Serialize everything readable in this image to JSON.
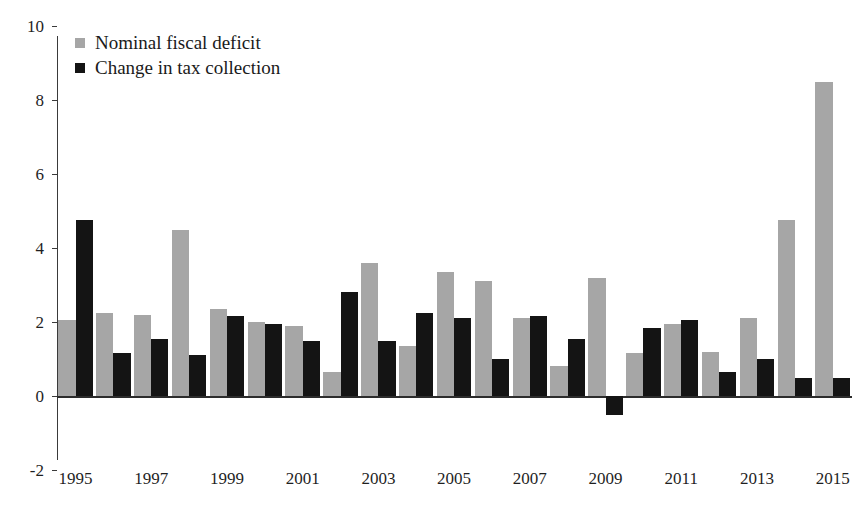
{
  "chart_data": {
    "type": "bar",
    "title": "",
    "subtitle": "",
    "xlabel": "",
    "ylabel": "",
    "ylim": [
      -2,
      10
    ],
    "ytick_labels": [
      "10",
      "8",
      "6",
      "4",
      "2",
      "0",
      "-2"
    ],
    "ytick_values": [
      10,
      8,
      6,
      4,
      2,
      0,
      -2
    ],
    "grid": false,
    "legend_position": "top-left",
    "categories": [
      "1995",
      "1996",
      "1997",
      "1998",
      "1999",
      "2000",
      "2001",
      "2002",
      "2003",
      "2004",
      "2005",
      "2006",
      "2007",
      "2008",
      "2009",
      "2010",
      "2011",
      "2012",
      "2013",
      "2014",
      "2015"
    ],
    "xtick_labels": [
      "1995",
      "1997",
      "1999",
      "2001",
      "2003",
      "2005",
      "2007",
      "2009",
      "2011",
      "2013",
      "2015"
    ],
    "series": [
      {
        "name": "Nominal fiscal deficit",
        "color": "#a6a6a6",
        "values": [
          2.05,
          2.25,
          2.2,
          4.5,
          2.35,
          2.0,
          1.9,
          0.65,
          3.6,
          1.35,
          3.35,
          3.1,
          2.1,
          0.8,
          3.2,
          1.15,
          1.95,
          1.2,
          2.1,
          4.75,
          8.5
        ]
      },
      {
        "name": "Change in tax collection",
        "color": "#141414",
        "values": [
          4.75,
          1.15,
          1.55,
          1.1,
          2.15,
          1.95,
          1.5,
          2.8,
          1.5,
          2.25,
          2.1,
          1.0,
          2.15,
          1.55,
          -0.5,
          1.85,
          2.05,
          0.65,
          1.0,
          0.5,
          0.5
        ]
      }
    ]
  },
  "legend": {
    "items": [
      {
        "label": "Nominal fiscal deficit",
        "swatch": "gray"
      },
      {
        "label": "Change in tax collection",
        "swatch": "black"
      }
    ]
  }
}
